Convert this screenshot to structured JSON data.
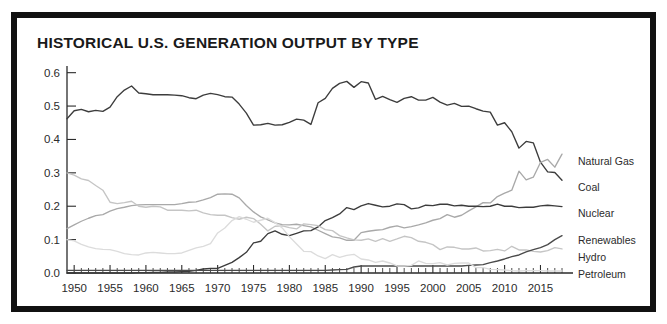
{
  "frame": {
    "border_color": "#111111",
    "background": "#ffffff"
  },
  "header": {
    "title": "HISTORICAL U.S. GENERATION OUTPUT BY TYPE"
  },
  "axes": {
    "y_ticks": [
      "0.0",
      "0.1",
      "0.2",
      "0.3",
      "0.4",
      "0.5",
      "0.6"
    ],
    "x_ticks": [
      "1950",
      "1955",
      "1960",
      "1965",
      "1970",
      "1975",
      "1980",
      "1985",
      "1990",
      "1995",
      "2000",
      "2005",
      "2010",
      "2015"
    ]
  },
  "series_labels": {
    "natural_gas": "Natural Gas",
    "coal": "Coal",
    "nuclear": "Nuclear",
    "renewables": "Renewables",
    "hydro": "Hydro",
    "petroleum": "Petroleum"
  },
  "chart_data": {
    "type": "line",
    "title": "HISTORICAL U.S. GENERATION OUTPUT BY TYPE",
    "xlabel": "",
    "ylabel": "",
    "xlim": [
      1949,
      2018
    ],
    "ylim": [
      0.0,
      0.62
    ],
    "grid": false,
    "legend_position": "right-inline-labels",
    "x": [
      1949,
      1950,
      1951,
      1952,
      1953,
      1954,
      1955,
      1956,
      1957,
      1958,
      1959,
      1960,
      1961,
      1962,
      1963,
      1964,
      1965,
      1966,
      1967,
      1968,
      1969,
      1970,
      1971,
      1972,
      1973,
      1974,
      1975,
      1976,
      1977,
      1978,
      1979,
      1980,
      1981,
      1982,
      1983,
      1984,
      1985,
      1986,
      1987,
      1988,
      1989,
      1990,
      1991,
      1992,
      1993,
      1994,
      1995,
      1996,
      1997,
      1998,
      1999,
      2000,
      2001,
      2002,
      2003,
      2004,
      2005,
      2006,
      2007,
      2008,
      2009,
      2010,
      2011,
      2012,
      2013,
      2014,
      2015,
      2016,
      2017,
      2018
    ],
    "series": [
      {
        "name": "Coal",
        "color": "#3c3c3c",
        "values": [
          0.462,
          0.486,
          0.49,
          0.483,
          0.487,
          0.484,
          0.497,
          0.528,
          0.548,
          0.56,
          0.539,
          0.537,
          0.534,
          0.534,
          0.534,
          0.533,
          0.531,
          0.525,
          0.522,
          0.533,
          0.538,
          0.534,
          0.528,
          0.527,
          0.506,
          0.479,
          0.443,
          0.444,
          0.448,
          0.443,
          0.444,
          0.451,
          0.461,
          0.458,
          0.445,
          0.51,
          0.523,
          0.553,
          0.568,
          0.574,
          0.556,
          0.573,
          0.569,
          0.52,
          0.529,
          0.519,
          0.511,
          0.523,
          0.528,
          0.518,
          0.518,
          0.526,
          0.512,
          0.503,
          0.508,
          0.499,
          0.5,
          0.492,
          0.485,
          0.482,
          0.443,
          0.45,
          0.423,
          0.374,
          0.394,
          0.39,
          0.332,
          0.303,
          0.301,
          0.278
        ]
      },
      {
        "name": "Natural Gas",
        "color": "#a9a9a9",
        "values": [
          0.133,
          0.144,
          0.155,
          0.164,
          0.172,
          0.175,
          0.185,
          0.193,
          0.197,
          0.202,
          0.204,
          0.205,
          0.205,
          0.205,
          0.205,
          0.205,
          0.208,
          0.212,
          0.213,
          0.219,
          0.226,
          0.236,
          0.237,
          0.236,
          0.225,
          0.202,
          0.183,
          0.168,
          0.159,
          0.15,
          0.145,
          0.144,
          0.146,
          0.142,
          0.138,
          0.128,
          0.118,
          0.108,
          0.105,
          0.098,
          0.098,
          0.121,
          0.125,
          0.128,
          0.13,
          0.137,
          0.141,
          0.135,
          0.139,
          0.144,
          0.15,
          0.158,
          0.163,
          0.175,
          0.167,
          0.173,
          0.186,
          0.198,
          0.211,
          0.21,
          0.229,
          0.239,
          0.248,
          0.305,
          0.279,
          0.287,
          0.331,
          0.34,
          0.317,
          0.356
        ]
      },
      {
        "name": "Nuclear",
        "color": "#3c3c3c",
        "values": [
          0.0,
          0.0,
          0.0,
          0.0,
          0.0,
          0.0,
          0.0,
          0.0,
          0.0,
          0.0,
          0.001,
          0.001,
          0.002,
          0.002,
          0.003,
          0.003,
          0.004,
          0.005,
          0.008,
          0.012,
          0.014,
          0.014,
          0.023,
          0.032,
          0.046,
          0.062,
          0.09,
          0.095,
          0.118,
          0.126,
          0.116,
          0.112,
          0.119,
          0.126,
          0.127,
          0.138,
          0.157,
          0.166,
          0.177,
          0.196,
          0.19,
          0.201,
          0.208,
          0.203,
          0.198,
          0.2,
          0.207,
          0.205,
          0.192,
          0.195,
          0.203,
          0.202,
          0.206,
          0.206,
          0.201,
          0.203,
          0.2,
          0.2,
          0.199,
          0.2,
          0.206,
          0.2,
          0.2,
          0.196,
          0.197,
          0.197,
          0.201,
          0.203,
          0.201,
          0.199
        ]
      },
      {
        "name": "Hydro",
        "color": "#c5c5c5",
        "values": [
          0.3,
          0.293,
          0.282,
          0.277,
          0.262,
          0.248,
          0.212,
          0.208,
          0.211,
          0.215,
          0.2,
          0.197,
          0.2,
          0.198,
          0.188,
          0.188,
          0.188,
          0.186,
          0.188,
          0.18,
          0.175,
          0.173,
          0.173,
          0.166,
          0.161,
          0.167,
          0.163,
          0.146,
          0.126,
          0.14,
          0.141,
          0.136,
          0.132,
          0.147,
          0.145,
          0.142,
          0.13,
          0.127,
          0.112,
          0.105,
          0.099,
          0.098,
          0.102,
          0.095,
          0.103,
          0.095,
          0.102,
          0.11,
          0.106,
          0.095,
          0.092,
          0.085,
          0.07,
          0.078,
          0.077,
          0.072,
          0.072,
          0.075,
          0.066,
          0.067,
          0.071,
          0.066,
          0.08,
          0.069,
          0.069,
          0.065,
          0.063,
          0.067,
          0.076,
          0.072
        ]
      },
      {
        "name": "Renewables",
        "color": "#4a4a4a",
        "values": [
          0.008,
          0.008,
          0.008,
          0.008,
          0.008,
          0.008,
          0.008,
          0.008,
          0.008,
          0.008,
          0.008,
          0.008,
          0.008,
          0.008,
          0.008,
          0.008,
          0.008,
          0.008,
          0.008,
          0.008,
          0.008,
          0.008,
          0.008,
          0.008,
          0.008,
          0.008,
          0.008,
          0.008,
          0.008,
          0.008,
          0.008,
          0.008,
          0.008,
          0.008,
          0.008,
          0.008,
          0.008,
          0.009,
          0.01,
          0.011,
          0.018,
          0.021,
          0.021,
          0.021,
          0.021,
          0.021,
          0.021,
          0.021,
          0.021,
          0.021,
          0.021,
          0.021,
          0.021,
          0.021,
          0.021,
          0.021,
          0.023,
          0.024,
          0.025,
          0.031,
          0.036,
          0.042,
          0.049,
          0.054,
          0.063,
          0.07,
          0.076,
          0.085,
          0.1,
          0.112
        ]
      },
      {
        "name": "Petroleum",
        "color": "#dcdcdc",
        "values": [
          0.1,
          0.096,
          0.086,
          0.078,
          0.073,
          0.071,
          0.07,
          0.065,
          0.058,
          0.055,
          0.054,
          0.06,
          0.062,
          0.06,
          0.058,
          0.058,
          0.06,
          0.068,
          0.075,
          0.08,
          0.088,
          0.12,
          0.135,
          0.157,
          0.169,
          0.161,
          0.152,
          0.158,
          0.164,
          0.151,
          0.135,
          0.109,
          0.087,
          0.065,
          0.064,
          0.051,
          0.043,
          0.055,
          0.047,
          0.053,
          0.056,
          0.042,
          0.039,
          0.032,
          0.036,
          0.03,
          0.021,
          0.021,
          0.023,
          0.036,
          0.029,
          0.028,
          0.031,
          0.024,
          0.029,
          0.03,
          0.03,
          0.016,
          0.016,
          0.011,
          0.01,
          0.009,
          0.007,
          0.006,
          0.007,
          0.007,
          0.007,
          0.006,
          0.006,
          0.006
        ]
      }
    ]
  }
}
